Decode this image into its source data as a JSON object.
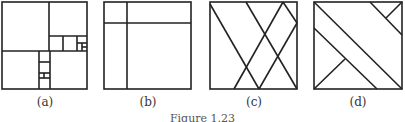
{
  "figure": {
    "caption": "Figure 1.23",
    "panels": [
      {
        "id": "a",
        "label": "(a)",
        "description": "Square subdivided into nested rectangles of decreasing size"
      },
      {
        "id": "b",
        "label": "(b)",
        "description": "Square divided by one vertical and one horizontal line"
      },
      {
        "id": "c",
        "label": "(c)",
        "description": "Square with crossing diagonal lines"
      },
      {
        "id": "d",
        "label": "(d)",
        "description": "Square with parallel diagonal lines and short perpendicular segments"
      }
    ],
    "stroke_color": "#222222"
  }
}
